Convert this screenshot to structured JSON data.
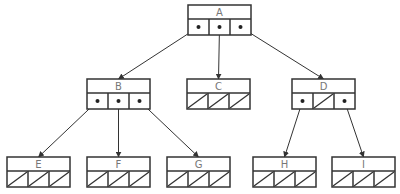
{
  "diagram": {
    "type": "tree",
    "stroke_color": "#333333",
    "label_color": "#777777",
    "nodes": [
      {
        "id": "A",
        "label": "A",
        "x": 188,
        "y": 5,
        "slots": [
          "ptr",
          "ptr",
          "ptr"
        ]
      },
      {
        "id": "B",
        "label": "B",
        "x": 87,
        "y": 79,
        "slots": [
          "ptr",
          "ptr",
          "ptr"
        ]
      },
      {
        "id": "C",
        "label": "C",
        "x": 187,
        "y": 79,
        "slots": [
          "null",
          "null",
          "null"
        ]
      },
      {
        "id": "D",
        "label": "D",
        "x": 292,
        "y": 79,
        "slots": [
          "ptr",
          "null",
          "ptr"
        ]
      },
      {
        "id": "E",
        "label": "E",
        "x": 7,
        "y": 157,
        "slots": [
          "null",
          "null",
          "null"
        ]
      },
      {
        "id": "F",
        "label": "F",
        "x": 87,
        "y": 157,
        "slots": [
          "null",
          "null",
          "null"
        ]
      },
      {
        "id": "G",
        "label": "G",
        "x": 167,
        "y": 157,
        "slots": [
          "null",
          "null",
          "null"
        ]
      },
      {
        "id": "H",
        "label": "H",
        "x": 253,
        "y": 157,
        "slots": [
          "null",
          "null",
          "null"
        ]
      },
      {
        "id": "I",
        "label": "I",
        "x": 332,
        "y": 157,
        "slots": [
          "null",
          "null",
          "null"
        ]
      }
    ],
    "edges": [
      {
        "from": "A",
        "slot": 0,
        "to": "B"
      },
      {
        "from": "A",
        "slot": 1,
        "to": "C"
      },
      {
        "from": "A",
        "slot": 2,
        "to": "D"
      },
      {
        "from": "B",
        "slot": 0,
        "to": "E"
      },
      {
        "from": "B",
        "slot": 1,
        "to": "F"
      },
      {
        "from": "B",
        "slot": 2,
        "to": "G"
      },
      {
        "from": "D",
        "slot": 0,
        "to": "H"
      },
      {
        "from": "D",
        "slot": 2,
        "to": "I"
      }
    ]
  }
}
